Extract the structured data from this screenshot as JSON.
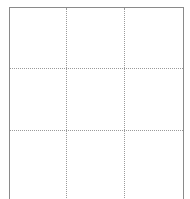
{
  "page": {
    "background_color": "#ffffff",
    "width": 190,
    "height": 199
  },
  "table": {
    "name": "empty-3x3-table",
    "border_color": "#8a8a8a",
    "gridline_color": "#9a9a9a",
    "gridline_style": "dotted",
    "border_sides_visible": "top-left-right",
    "bottom_border_visible": false,
    "clipped_at_viewport_bottom": true,
    "columns": 3,
    "rows": 3,
    "column_x_positions": [
      9,
      67,
      125,
      184
    ],
    "row_y_positions": [
      7,
      69,
      131,
      199
    ],
    "cells": [
      {
        "row": 0,
        "col": 0,
        "text": ""
      },
      {
        "row": 0,
        "col": 1,
        "text": ""
      },
      {
        "row": 0,
        "col": 2,
        "text": ""
      },
      {
        "row": 1,
        "col": 0,
        "text": ""
      },
      {
        "row": 1,
        "col": 1,
        "text": ""
      },
      {
        "row": 1,
        "col": 2,
        "text": ""
      },
      {
        "row": 2,
        "col": 0,
        "text": ""
      },
      {
        "row": 2,
        "col": 1,
        "text": ""
      },
      {
        "row": 2,
        "col": 2,
        "text": ""
      }
    ]
  }
}
